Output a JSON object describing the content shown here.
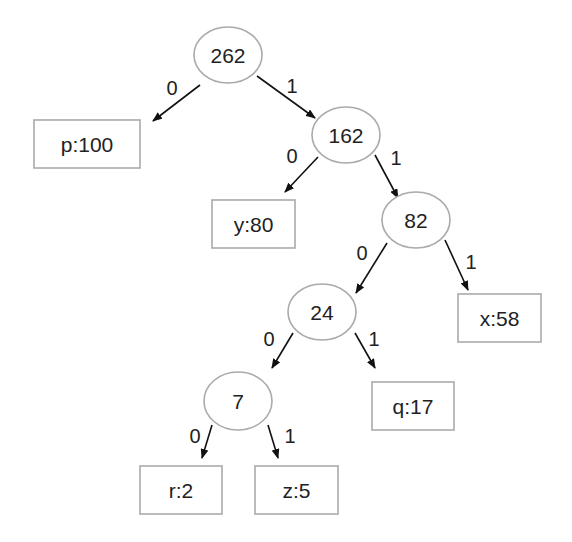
{
  "diagram": {
    "type": "huffman-tree",
    "colors": {
      "node_stroke": "#aaaaaa",
      "edge": "#111111",
      "text": "#222222",
      "background": "#ffffff"
    },
    "nodes": [
      {
        "id": "n262",
        "kind": "internal",
        "label": "262",
        "cx": 228,
        "cy": 55
      },
      {
        "id": "p",
        "kind": "leaf",
        "label": "p:100",
        "x": 34,
        "y": 120,
        "w": 106,
        "h": 48
      },
      {
        "id": "n162",
        "kind": "internal",
        "label": "162",
        "cx": 346,
        "cy": 135
      },
      {
        "id": "y",
        "kind": "leaf",
        "label": "y:80",
        "x": 212,
        "y": 200,
        "w": 83,
        "h": 48
      },
      {
        "id": "n82",
        "kind": "internal",
        "label": "82",
        "cx": 416,
        "cy": 220
      },
      {
        "id": "n24",
        "kind": "internal",
        "label": "24",
        "cx": 322,
        "cy": 312
      },
      {
        "id": "x",
        "kind": "leaf",
        "label": "x:58",
        "x": 458,
        "y": 294,
        "w": 83,
        "h": 48
      },
      {
        "id": "n7",
        "kind": "internal",
        "label": "7",
        "cx": 238,
        "cy": 401
      },
      {
        "id": "q",
        "kind": "leaf",
        "label": "q:17",
        "x": 372,
        "y": 382,
        "w": 82,
        "h": 48
      },
      {
        "id": "r",
        "kind": "leaf",
        "label": "r:2",
        "x": 140,
        "y": 466,
        "w": 82,
        "h": 48
      },
      {
        "id": "z",
        "kind": "leaf",
        "label": "z:5",
        "x": 255,
        "y": 466,
        "w": 83,
        "h": 48
      }
    ],
    "edges": [
      {
        "from": "n262",
        "to": "p",
        "label": "0",
        "x1": 200,
        "y1": 85,
        "x2": 153,
        "y2": 121,
        "lx": 172,
        "ly": 88
      },
      {
        "from": "n262",
        "to": "n162",
        "label": "1",
        "x1": 257,
        "y1": 76,
        "x2": 315,
        "y2": 118,
        "lx": 292,
        "ly": 86
      },
      {
        "from": "n162",
        "to": "y",
        "label": "0",
        "x1": 318,
        "y1": 157,
        "x2": 285,
        "y2": 192,
        "lx": 292,
        "ly": 156
      },
      {
        "from": "n162",
        "to": "n82",
        "label": "1",
        "x1": 375,
        "y1": 155,
        "x2": 398,
        "y2": 198,
        "lx": 396,
        "ly": 158
      },
      {
        "from": "n82",
        "to": "n24",
        "label": "0",
        "x1": 387,
        "y1": 243,
        "x2": 356,
        "y2": 293,
        "lx": 362,
        "ly": 253
      },
      {
        "from": "n82",
        "to": "x",
        "label": "1",
        "x1": 445,
        "y1": 240,
        "x2": 468,
        "y2": 290,
        "lx": 471,
        "ly": 262
      },
      {
        "from": "n24",
        "to": "n7",
        "label": "0",
        "x1": 293,
        "y1": 333,
        "x2": 272,
        "y2": 368,
        "lx": 269,
        "ly": 339
      },
      {
        "from": "n24",
        "to": "q",
        "label": "1",
        "x1": 355,
        "y1": 333,
        "x2": 375,
        "y2": 368,
        "lx": 374,
        "ly": 339
      },
      {
        "from": "n7",
        "to": "r",
        "label": "0",
        "x1": 212,
        "y1": 425,
        "x2": 202,
        "y2": 458,
        "lx": 195,
        "ly": 436
      },
      {
        "from": "n7",
        "to": "z",
        "label": "1",
        "x1": 268,
        "y1": 425,
        "x2": 278,
        "y2": 458,
        "lx": 290,
        "ly": 436
      }
    ]
  }
}
